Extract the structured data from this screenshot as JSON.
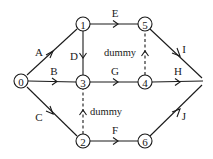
{
  "diagram": {
    "type": "activity-on-arrow network",
    "nodes": [
      {
        "id": "0",
        "label": "0",
        "x": 21,
        "y": 81
      },
      {
        "id": "1",
        "label": "1",
        "x": 83,
        "y": 24
      },
      {
        "id": "2",
        "label": "2",
        "x": 83,
        "y": 141
      },
      {
        "id": "3",
        "label": "3",
        "x": 83,
        "y": 82
      },
      {
        "id": "4",
        "label": "4",
        "x": 145,
        "y": 82
      },
      {
        "id": "5",
        "label": "5",
        "x": 145,
        "y": 24
      },
      {
        "id": "6",
        "label": "6",
        "x": 145,
        "y": 141
      }
    ],
    "end_point": {
      "x": 203,
      "y": 81
    },
    "edges": [
      {
        "label": "A",
        "from": "0",
        "to": "1",
        "dashed": false
      },
      {
        "label": "B",
        "from": "0",
        "to": "3",
        "dashed": false
      },
      {
        "label": "C",
        "from": "0",
        "to": "2",
        "dashed": false
      },
      {
        "label": "D",
        "from": "1",
        "to": "3",
        "dashed": false
      },
      {
        "label": "E",
        "from": "1",
        "to": "5",
        "dashed": false
      },
      {
        "label": "F",
        "from": "2",
        "to": "6",
        "dashed": false
      },
      {
        "label": "G",
        "from": "3",
        "to": "4",
        "dashed": false
      },
      {
        "label": "H",
        "from": "4",
        "to": "end",
        "dashed": false
      },
      {
        "label": "I",
        "from": "5",
        "to": "end",
        "dashed": false
      },
      {
        "label": "J",
        "from": "6",
        "to": "end",
        "dashed": false
      },
      {
        "label": "dummy",
        "from": "4",
        "to": "5",
        "dashed": true
      },
      {
        "label": "dummy",
        "from": "2",
        "to": "3",
        "dashed": true
      }
    ],
    "labels": {
      "A": "A",
      "B": "B",
      "C": "C",
      "D": "D",
      "E": "E",
      "F": "F",
      "G": "G",
      "H": "H",
      "I": "I",
      "J": "J",
      "dummy_top": "dummy",
      "dummy_bottom": "dummy"
    },
    "colors": {
      "line": "#1a1a1a",
      "background": "#ffffff"
    }
  }
}
